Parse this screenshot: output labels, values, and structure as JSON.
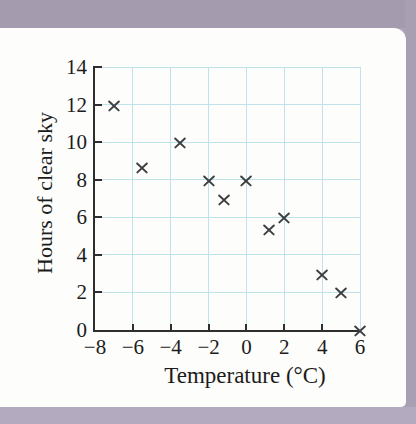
{
  "page": {
    "band_top_color": "#a49cae",
    "band_right_color": "#a89fb3",
    "band_bottom_color": "#b3aabf",
    "card_color": "#fdfdfb"
  },
  "chart_data": {
    "type": "scatter",
    "title": "",
    "xlabel": "Temperature (°C)",
    "ylabel": "Hours of clear sky",
    "xlim": [
      -8,
      6
    ],
    "ylim": [
      0,
      14
    ],
    "x_ticks": [
      -8,
      -6,
      -4,
      -2,
      0,
      2,
      4,
      6
    ],
    "x_tick_labels": [
      "−8",
      "−6",
      "−4",
      "−2",
      "0",
      "2",
      "4",
      "6"
    ],
    "y_ticks": [
      0,
      2,
      4,
      6,
      8,
      10,
      12,
      14
    ],
    "y_tick_labels": [
      "0",
      "2",
      "4",
      "6",
      "8",
      "10",
      "12",
      "14"
    ],
    "x_gridlines": [
      -6,
      -4,
      -2,
      0,
      2,
      4,
      6
    ],
    "y_gridlines": [
      2,
      4,
      6,
      8,
      10,
      12,
      14
    ],
    "x_tick_marks": [
      -6,
      -4,
      -2,
      0,
      2,
      4
    ],
    "y_tick_marks": [
      2,
      4,
      6,
      8,
      10,
      12,
      14
    ],
    "grid": true,
    "grid_color": "#bfe3ea",
    "axis_color": "#2e2e2e",
    "marker": "x",
    "marker_color": "#3d4043",
    "legend": null,
    "points": [
      {
        "x": -7,
        "y": 12
      },
      {
        "x": -5.5,
        "y": 8.7
      },
      {
        "x": -3.5,
        "y": 10
      },
      {
        "x": -2,
        "y": 8
      },
      {
        "x": -1.2,
        "y": 7
      },
      {
        "x": 0,
        "y": 8
      },
      {
        "x": 1.2,
        "y": 5.4
      },
      {
        "x": 2,
        "y": 6
      },
      {
        "x": 4,
        "y": 3
      },
      {
        "x": 5,
        "y": 2
      },
      {
        "x": 6,
        "y": 0
      }
    ]
  }
}
